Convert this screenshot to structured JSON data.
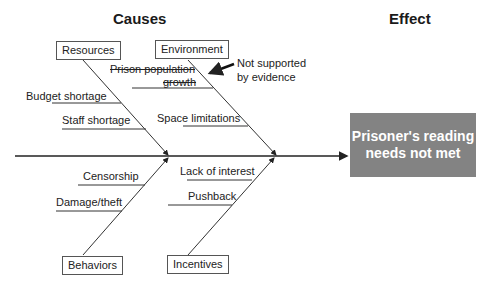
{
  "headers": {
    "causes": "Causes",
    "effect": "Effect"
  },
  "effect_box": {
    "text": "Prisoner's reading needs not met",
    "color": "#838383"
  },
  "categories": {
    "resources": {
      "label": "Resources",
      "causes": [
        "Budget shortage",
        "Staff shortage"
      ]
    },
    "environment": {
      "label": "Environment",
      "causes": [
        "Prison population growth",
        "Space limitations"
      ],
      "struck": [
        "Prison population growth"
      ]
    },
    "behaviors": {
      "label": "Behaviors",
      "causes": [
        "Censorship",
        "Damage/theft"
      ]
    },
    "incentives": {
      "label": "Incentives",
      "causes": [
        "Lack of interest",
        "Pushback"
      ]
    }
  },
  "annotation": {
    "line1": "Not supported",
    "line2": "by evidence",
    "icon": "arrow-left-icon"
  },
  "labels": {
    "ppg1": "Prison population",
    "ppg2": "growth"
  }
}
